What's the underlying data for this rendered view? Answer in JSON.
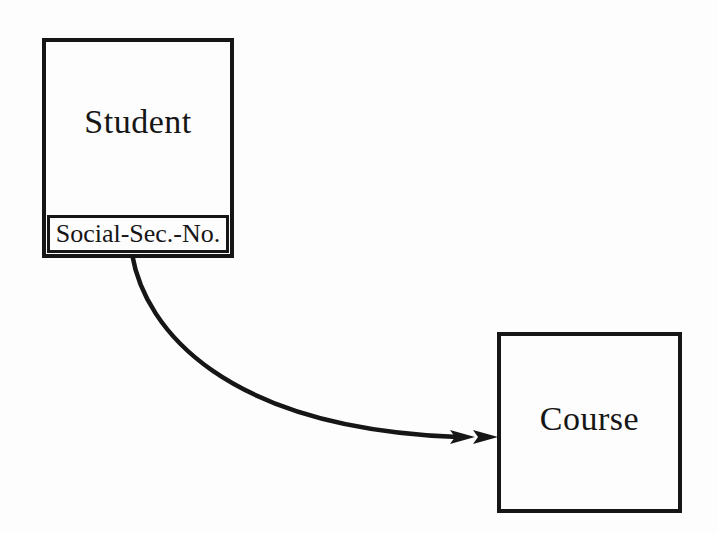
{
  "colors": {
    "ink": "#161616",
    "background": "#fdfdfd"
  },
  "diagram": {
    "type": "object-model-class-diagram",
    "nodes": [
      {
        "title": "Student",
        "attributes": [
          "Social-Sec.-No."
        ]
      },
      {
        "title": "Course",
        "attributes": []
      }
    ],
    "edges": [
      {
        "from": "Student",
        "to": "Course",
        "shape": "curved-arc",
        "arrowhead": "double-filled-triangle"
      }
    ]
  }
}
